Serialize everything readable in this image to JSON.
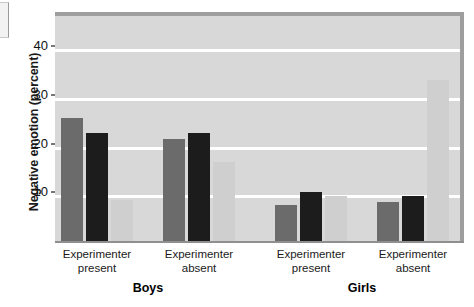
{
  "chart_data": {
    "type": "bar",
    "title": "",
    "xlabel": "",
    "ylabel": "Negative emotion (percent)",
    "ylim": [
      0,
      47
    ],
    "yticks": [
      10,
      20,
      30,
      40
    ],
    "ytick_labels": [
      "10",
      "20",
      "30",
      "40"
    ],
    "grid": true,
    "legend": "none",
    "categories": [
      "Experimenter present",
      "Experimenter absent",
      "Experimenter present",
      "Experimenter absent"
    ],
    "category_lines": [
      [
        "Experimenter",
        "present"
      ],
      [
        "Experimenter",
        "absent"
      ],
      [
        "Experimenter",
        "present"
      ],
      [
        "Experimenter",
        "absent"
      ]
    ],
    "groups": [
      "Boys",
      "Girls"
    ],
    "series": [
      {
        "name": "series-1",
        "color": "#6b6b6b",
        "values": [
          25.2,
          21.0,
          7.3,
          8.0
        ]
      },
      {
        "name": "series-2",
        "color": "#1c1c1c",
        "values": [
          22.2,
          22.2,
          10.0,
          9.2
        ]
      },
      {
        "name": "series-3",
        "color": "#cfcfcf",
        "values": [
          8.5,
          16.2,
          9.2,
          33.0
        ]
      }
    ]
  },
  "axis": {
    "y_title": "Negative emotion (percent)"
  },
  "colors": {
    "plot_background": "#d8d8d8",
    "gridline": "#ffffff",
    "axis": "#8f8f8f",
    "series_1": "#6b6b6b",
    "series_2": "#1c1c1c",
    "series_3": "#cfcfcf",
    "text": "#1a1a1a"
  }
}
